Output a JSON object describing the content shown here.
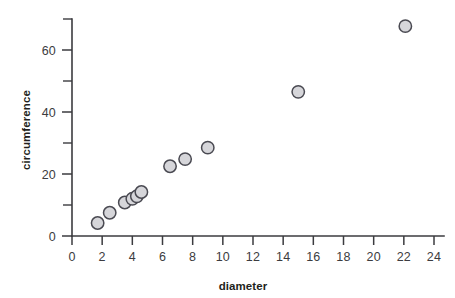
{
  "chart_data": {
    "type": "scatter",
    "title": "",
    "xlabel": "diameter",
    "ylabel": "circumference",
    "xlim": [
      0,
      24
    ],
    "ylim": [
      0,
      70
    ],
    "grid": false,
    "legend": false,
    "x_ticks": [
      0,
      2,
      4,
      6,
      8,
      10,
      12,
      14,
      16,
      18,
      20,
      22,
      24
    ],
    "x_tick_labels": [
      "0",
      "2",
      "4",
      "6",
      "8",
      "10",
      "12",
      "14",
      "16",
      "18",
      "20",
      "22",
      "24"
    ],
    "y_ticks": [
      0,
      10,
      20,
      30,
      40,
      50,
      60,
      70
    ],
    "y_tick_labels": [
      "0",
      "",
      "20",
      "",
      "40",
      "",
      "60",
      ""
    ],
    "y_labeled_ticks": [
      0,
      20,
      40,
      60
    ],
    "series": [
      {
        "name": "measurements",
        "marker": "circle",
        "marker_color": "#d6d6da",
        "marker_edge_color": "#4a4a52",
        "points": [
          {
            "x": 1.7,
            "y": 4.2
          },
          {
            "x": 2.5,
            "y": 7.5
          },
          {
            "x": 3.5,
            "y": 10.8
          },
          {
            "x": 4.0,
            "y": 12.0
          },
          {
            "x": 4.3,
            "y": 12.8
          },
          {
            "x": 4.6,
            "y": 14.2
          },
          {
            "x": 6.5,
            "y": 22.5
          },
          {
            "x": 7.5,
            "y": 24.8
          },
          {
            "x": 9.0,
            "y": 28.5
          },
          {
            "x": 15.0,
            "y": 46.5
          },
          {
            "x": 22.1,
            "y": 67.7
          }
        ]
      }
    ]
  },
  "colors": {
    "axis": "#3b3b3f",
    "text": "#231f20",
    "marker_fill": "#d6d6da",
    "marker_edge": "#4a4a52",
    "background": "#ffffff"
  }
}
